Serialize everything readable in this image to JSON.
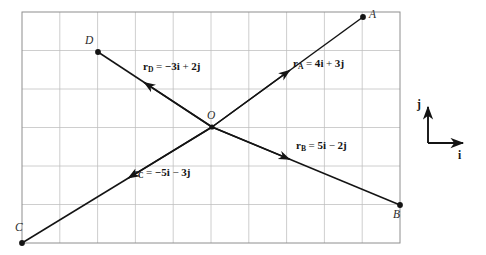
{
  "figure": {
    "type": "vector-diagram",
    "grid": {
      "columns": 10,
      "rows": 6,
      "cell_px": 37.8,
      "frame": {
        "x": 22,
        "y": 12,
        "width": 378,
        "height": 231
      },
      "line_color": "#b9b9b9",
      "frame_color": "#8a8a8a"
    },
    "origin": {
      "label": "O",
      "x": 212,
      "y": 127,
      "grid": [
        5,
        3
      ]
    },
    "points": [
      {
        "name": "A",
        "label": "A",
        "x": 363,
        "y": 17,
        "label_x": 369,
        "label_y": 10
      },
      {
        "name": "B",
        "label": "B",
        "x": 400,
        "y": 205,
        "label_x": 392,
        "label_y": 208
      },
      {
        "name": "C",
        "label": "C",
        "x": 22,
        "y": 243,
        "label_x": 14,
        "label_y": 222
      },
      {
        "name": "D",
        "label": "D",
        "x": 98,
        "y": 52,
        "label_x": 84,
        "label_y": 35
      }
    ],
    "vectors": [
      {
        "name": "r_A",
        "symbol": "r",
        "subscript": "A",
        "equation": "= 4i + 3j",
        "i_coefficient": 4,
        "j_coefficient": 3,
        "terms": {
          "eq": "=",
          "i_term": "4i",
          "op": "+",
          "j_term": "3j"
        },
        "from": "O",
        "to": "A",
        "label_x": 293,
        "label_y": 63
      },
      {
        "name": "r_B",
        "symbol": "r",
        "subscript": "B",
        "equation": "= 5i − 2j",
        "i_coefficient": 5,
        "j_coefficient": -2,
        "terms": {
          "eq": "=",
          "i_term": "5i",
          "op": "−",
          "j_term": "2j"
        },
        "from": "O",
        "to": "B",
        "label_x": 296,
        "label_y": 145
      },
      {
        "name": "r_C",
        "symbol": "r",
        "subscript": "C",
        "equation": "= −5i − 3j",
        "i_coefficient": -5,
        "j_coefficient": -3,
        "terms": {
          "eq": "=",
          "i_term": "−5i",
          "op": "−",
          "j_term": "3j"
        },
        "from": "O",
        "to": "C",
        "label_x": 133,
        "label_y": 172
      },
      {
        "name": "r_D",
        "symbol": "r",
        "subscript": "D",
        "equation": "= −3i + 2j",
        "i_coefficient": -3,
        "j_coefficient": 2,
        "terms": {
          "eq": "=",
          "i_term": "−3i",
          "op": "+",
          "j_term": "2j"
        },
        "from": "O",
        "to": "D",
        "label_x": 143,
        "label_y": 66
      }
    ],
    "axis_key": {
      "i_label": "i",
      "j_label": "j",
      "corner_x": 428,
      "corner_y": 143,
      "j_tip_y": 104,
      "i_tip_x": 466,
      "i_label_x": 459,
      "i_label_y": 150,
      "j_label_x": 418,
      "j_label_y": 99
    },
    "colors": {
      "ink": "#141414",
      "grid": "#b9b9b9",
      "frame": "#8a8a8a",
      "background": "#ffffff"
    }
  }
}
